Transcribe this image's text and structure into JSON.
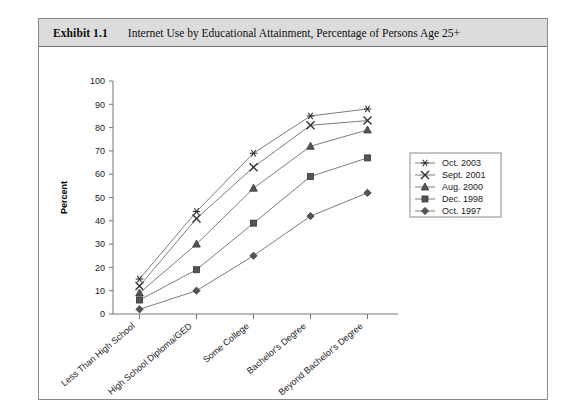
{
  "exhibit": {
    "number": "Exhibit 1.1",
    "title": "Internet Use by Educational Attainment, Percentage of Persons Age 25+"
  },
  "chart_data": {
    "type": "line",
    "title": "Internet Use by Educational Attainment, Percentage of Persons Age 25+",
    "xlabel": "",
    "ylabel": "Percent",
    "ylim": [
      0,
      100
    ],
    "ytick_step": 10,
    "yticks": [
      0,
      10,
      20,
      30,
      40,
      50,
      60,
      70,
      80,
      90,
      100
    ],
    "grid": false,
    "legend_position": "right",
    "categories": [
      "Less Than High School",
      "High School Diploma/GED",
      "Some College",
      "Bachelor's Degree",
      "Beyond Bachelor's Degree"
    ],
    "series": [
      {
        "name": "Oct. 2003",
        "marker": "star",
        "values": [
          15,
          44,
          69,
          85,
          88
        ]
      },
      {
        "name": "Sept. 2001",
        "marker": "x",
        "values": [
          12,
          41,
          63,
          81,
          83
        ]
      },
      {
        "name": "Aug. 2000",
        "marker": "triangle",
        "values": [
          9,
          30,
          54,
          72,
          79
        ]
      },
      {
        "name": "Dec. 1998",
        "marker": "square",
        "values": [
          6,
          19,
          39,
          59,
          67
        ]
      },
      {
        "name": "Oct. 1997",
        "marker": "diamond",
        "values": [
          2,
          10,
          25,
          42,
          52
        ]
      }
    ]
  },
  "legend": {
    "items": [
      {
        "label": "Oct. 2003"
      },
      {
        "label": "Sept. 2001"
      },
      {
        "label": "Aug. 2000"
      },
      {
        "label": "Dec. 1998"
      },
      {
        "label": "Oct. 1997"
      }
    ]
  },
  "colors": {
    "header_bg": "#dcdcdc",
    "frame_border": "#8a8a8a",
    "axis": "#777777",
    "line": "#6e6e6e",
    "marker": "#555555",
    "text": "#1a1a1a"
  }
}
